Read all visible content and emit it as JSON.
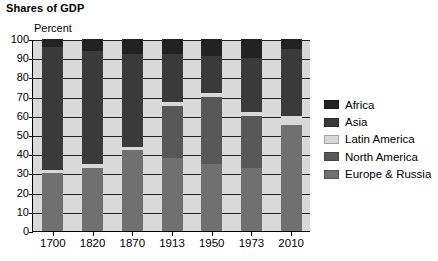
{
  "title": "Shares of GDP",
  "chart_data": {
    "type": "bar",
    "subtype": "stacked-100-percent",
    "title": "Shares of GDP",
    "xlabel": "",
    "ylabel": "Percent",
    "ylim": [
      0,
      100
    ],
    "yticks": [
      0,
      10,
      20,
      30,
      40,
      50,
      60,
      70,
      80,
      90,
      100
    ],
    "grid": true,
    "legend_position": "right",
    "categories": [
      "1700",
      "1820",
      "1870",
      "1913",
      "1950",
      "1973",
      "2010"
    ],
    "series": [
      {
        "name": "Europe & Russia",
        "color": "#707070",
        "values": [
          30,
          33,
          42,
          38,
          35,
          33,
          55
        ]
      },
      {
        "name": "North America",
        "color": "#585858",
        "values": [
          0,
          0,
          0,
          27,
          35,
          27,
          0
        ]
      },
      {
        "name": "Latin America",
        "color": "#d8d8d8",
        "values": [
          2,
          2,
          2,
          2,
          2,
          2,
          5
        ]
      },
      {
        "name": "Asia",
        "color": "#3a3a3a",
        "values": [
          64,
          59,
          48,
          25,
          19,
          28,
          35
        ]
      },
      {
        "name": "Africa",
        "color": "#222222",
        "values": [
          4,
          6,
          8,
          8,
          9,
          10,
          5
        ]
      }
    ],
    "legend_order": [
      "Africa",
      "Asia",
      "Latin America",
      "North America",
      "Europe & Russia"
    ],
    "stack_order_bottom_to_top": [
      "Europe & Russia",
      "North America",
      "Latin America",
      "Asia",
      "Africa"
    ]
  },
  "colors": {
    "africa": "#222222",
    "asia": "#3a3a3a",
    "latin_america": "#d8d8d8",
    "north_america": "#585858",
    "europe_russia": "#707070",
    "plot_background": "#d9d9d9",
    "axis": "#000000"
  }
}
